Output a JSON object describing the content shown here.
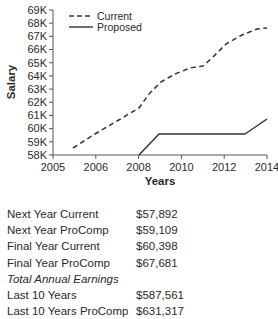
{
  "chart_data": {
    "type": "line",
    "title": "",
    "xlabel": "Years",
    "ylabel": "Salary",
    "x_tick_labels": [
      "2005",
      "2006",
      "2008",
      "2010",
      "2012",
      "2014"
    ],
    "y_tick_labels": [
      "58K",
      "59K",
      "60K",
      "61K",
      "62K",
      "63K",
      "64K",
      "65K",
      "66K",
      "67K",
      "68K",
      "69K"
    ],
    "ylim": [
      58000,
      69000
    ],
    "xlim": [
      2005,
      2014
    ],
    "grid": false,
    "legend_position": "upper-left",
    "series": [
      {
        "name": "Current",
        "style": "dashed",
        "x": [
          2005.5,
          2006,
          2006.5,
          2007,
          2007.25,
          2007.5,
          2007.8,
          2008.2,
          2008.5,
          2008.7,
          2009.0,
          2009.4,
          2009.75,
          2010
        ],
        "points_px": [
          [
            73,
            148
          ],
          [
            95,
            134
          ],
          [
            117,
            121
          ],
          [
            139,
            108
          ],
          [
            149,
            94
          ],
          [
            161,
            82
          ],
          [
            175,
            74
          ],
          [
            190,
            68
          ],
          [
            203,
            66
          ],
          [
            213,
            57
          ],
          [
            226,
            44
          ],
          [
            242,
            35
          ],
          [
            257,
            29
          ],
          [
            267,
            28
          ]
        ],
        "values": [
          58500,
          59600,
          60600,
          61600,
          62700,
          63500,
          64100,
          64600,
          64700,
          65400,
          66400,
          67100,
          67500,
          67600
        ]
      },
      {
        "name": "Proposed",
        "style": "solid",
        "points_px": [
          [
            139,
            155
          ],
          [
            159,
            134
          ],
          [
            245,
            134
          ],
          [
            267,
            119
          ]
        ],
        "values": [
          58000,
          59600,
          59600,
          60700
        ]
      }
    ]
  },
  "legend": [
    {
      "label": "Current",
      "style": "dashed"
    },
    {
      "label": "Proposed",
      "style": "solid"
    }
  ],
  "summary": {
    "rows": [
      {
        "label": "Next Year Current",
        "value": "$57,892"
      },
      {
        "label": "Next Year ProComp",
        "value": "$59,109"
      },
      {
        "label": "Final Year Current",
        "value": "$60,398"
      },
      {
        "label": "Final Year ProComp",
        "value": "$67,681"
      }
    ],
    "section_title": "Total Annual Earnings",
    "totals": [
      {
        "label": "Last 10 Years",
        "value": "$587,561"
      },
      {
        "label": "Last 10 Years ProComp",
        "value": "$631,317"
      }
    ]
  },
  "colors": {
    "line": "#333333",
    "axis": "#555555",
    "text": "#2a2a2a"
  }
}
